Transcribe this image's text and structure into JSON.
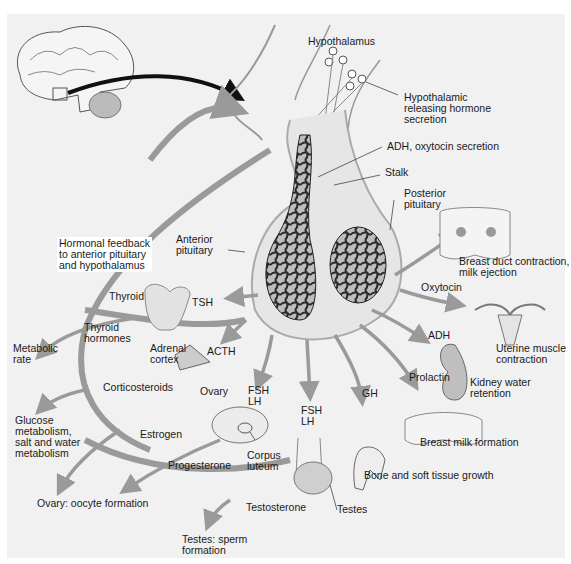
{
  "diagram": {
    "topic": "Pituitary gland hormones and target organs",
    "colors": {
      "background": "#f1f1f1",
      "arrow": "#9a9a9a",
      "vessel": "#2b2b2b",
      "gland_fill": "#d9d9d9",
      "label_text": "#1a1a1a"
    },
    "labels": {
      "hypothalamus": "Hypothalamus",
      "hyp_releasing": "Hypothalamic\nreleasing hormone\nsecretion",
      "adh_oxytocin_secretion": "ADH, oxytocin secretion",
      "stalk": "Stalk",
      "posterior_pituitary": "Posterior\npituitary",
      "anterior_pituitary": "Anterior\npituitary",
      "hormonal_feedback": "Hormonal feedback\nto anterior pituitary\nand hypothalamus",
      "thyroid": "Thyroid",
      "tsh": "TSH",
      "thyroid_hormones": "Thyroid\nhormones",
      "metabolic_rate": "Metabolic\nrate",
      "adrenal_cortex": "Adrenal\ncortex",
      "acth": "ACTH",
      "corticosteroids": "Corticosteroids",
      "glucose_metabolism": "Glucose\nmetabolism,\nsalt and water\nmetabolism",
      "ovary": "Ovary",
      "fsh_lh_ovary": "FSH\nLH",
      "fsh_lh_testes": "FSH\nLH",
      "estrogen": "Estrogen",
      "corpus_luteum": "Corpus\nluteum",
      "progesterone": "Progesterone",
      "ovary_oocyte": "Ovary: oocyte formation",
      "testosterone": "Testosterone",
      "testes": "Testes",
      "testes_sperm": "Testes: sperm\nformation",
      "gh": "GH",
      "bone_growth": "Bone and soft tissue growth",
      "prolactin": "Prolactin",
      "breast_milk_formation": "Breast milk formation",
      "adh": "ADH",
      "kidney_water": "Kidney water\nretention",
      "oxytocin": "Oxytocin",
      "uterine": "Uterine muscle\ncontraction",
      "breast_duct": "Breast duct contraction,\nmilk ejection"
    }
  }
}
